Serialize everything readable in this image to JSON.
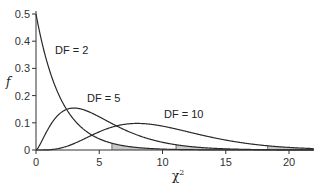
{
  "chart_data": {
    "type": "line",
    "title": "",
    "xlabel": "χ²",
    "ylabel": "f",
    "xlim": [
      0,
      22
    ],
    "ylim": [
      0,
      0.52
    ],
    "grid": false,
    "legend": "inline labels",
    "x_ticks": [
      0,
      5,
      10,
      15,
      20
    ],
    "x_tick_labels": [
      "0",
      "5",
      "10",
      "15",
      "20"
    ],
    "y_ticks": [
      0,
      0.1,
      0.2,
      0.3,
      0.4,
      0.5
    ],
    "y_tick_labels": [
      "0",
      "0.1",
      "0.2",
      "0.3",
      "0.4",
      "0.5"
    ],
    "series": [
      {
        "name": "DF = 2",
        "df": 2,
        "label": "DF = 2",
        "shade_from": 6.0,
        "x": [
          0,
          1,
          2,
          3,
          4,
          5,
          6,
          8,
          10,
          12,
          15,
          20,
          22
        ],
        "values": [
          0.5,
          0.303,
          0.184,
          0.112,
          0.068,
          0.041,
          0.025,
          0.009,
          0.003,
          0.001,
          0.0003,
          0.0,
          0.0
        ]
      },
      {
        "name": "DF = 5",
        "df": 5,
        "label": "DF = 5",
        "shade_from": 11.07,
        "x": [
          0,
          1,
          2,
          3,
          4,
          5,
          6,
          8,
          10,
          12,
          15,
          20,
          22
        ],
        "values": [
          0,
          0.081,
          0.138,
          0.154,
          0.144,
          0.122,
          0.098,
          0.055,
          0.028,
          0.013,
          0.004,
          0.0005,
          0.0002
        ]
      },
      {
        "name": "DF = 10",
        "df": 10,
        "label": "DF = 10",
        "shade_from": 18.31,
        "x": [
          0,
          2,
          4,
          6,
          8,
          10,
          12,
          14,
          16,
          18,
          20,
          22
        ],
        "values": [
          0,
          0.008,
          0.045,
          0.083,
          0.098,
          0.088,
          0.066,
          0.043,
          0.026,
          0.014,
          0.007,
          0.004
        ]
      }
    ],
    "annotations": [
      "DF = 2",
      "DF = 5",
      "DF = 10"
    ]
  },
  "labels": {
    "xlabel_base": "χ",
    "xlabel_sup": "2",
    "ylabel": "f"
  }
}
